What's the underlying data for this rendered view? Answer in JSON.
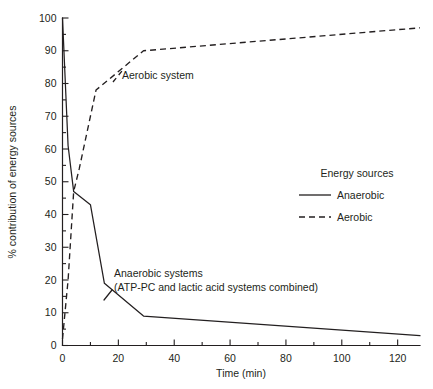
{
  "chart_data": {
    "type": "line",
    "title": "",
    "subtitle": "",
    "xlabel": "Time (min)",
    "ylabel": "% contribution of energy sources",
    "xlim": [
      0,
      128
    ],
    "ylim": [
      0,
      100
    ],
    "grid": false,
    "legend_position": "right-middle",
    "legend_title": "Energy sources",
    "x_ticks_major": [
      0,
      20,
      40,
      60,
      80,
      100,
      120
    ],
    "x_tick_labels": [
      "0",
      "20",
      "40",
      "60",
      "80",
      "100",
      "120"
    ],
    "x_ticks_minor": [
      10,
      30,
      50,
      70,
      90,
      110
    ],
    "y_ticks_major": [
      0,
      10,
      20,
      30,
      40,
      50,
      60,
      70,
      80,
      90,
      100
    ],
    "y_tick_labels": [
      "0",
      "10",
      "20",
      "30",
      "40",
      "50",
      "60",
      "70",
      "80",
      "90",
      "100"
    ],
    "y_ticks_minor": [
      5,
      15,
      25,
      35,
      45,
      55,
      65,
      75,
      85,
      95
    ],
    "series": [
      {
        "name": "Anaerobic",
        "style": "solid",
        "color": "#231f20",
        "x": [
          0,
          2,
          4,
          10,
          15,
          29,
          128
        ],
        "values": [
          100,
          61,
          47,
          43,
          19,
          9,
          3
        ]
      },
      {
        "name": "Aerobic",
        "style": "dashed",
        "color": "#231f20",
        "x": [
          0,
          2,
          4,
          6,
          12,
          29,
          128
        ],
        "values": [
          2,
          20,
          47,
          54,
          78,
          90,
          97
        ]
      }
    ],
    "annotations": [
      {
        "id": "aerobic-annotation",
        "text": "Aerobic system",
        "x": 17,
        "y": 76
      },
      {
        "id": "anaerobic-annotation",
        "line1": "Anaerobic systems",
        "line2": "(ATP-PC and lactic acid systems combined)",
        "x": 16,
        "y": 20
      }
    ]
  },
  "legend": {
    "title": "Energy sources",
    "entries": [
      {
        "label": "Anaerobic",
        "style": "solid"
      },
      {
        "label": "Aerobic",
        "style": "dashed"
      }
    ]
  },
  "axes": {
    "x_title": "Time (min)",
    "y_title": "% contribution of energy sources"
  },
  "annotations": {
    "aerobic": "Aerobic system",
    "anaerobic_line1": "Anaerobic systems",
    "anaerobic_line2": "(ATP-PC and lactic acid systems combined)"
  },
  "colors": {
    "ink": "#231f20",
    "background": "#ffffff"
  }
}
